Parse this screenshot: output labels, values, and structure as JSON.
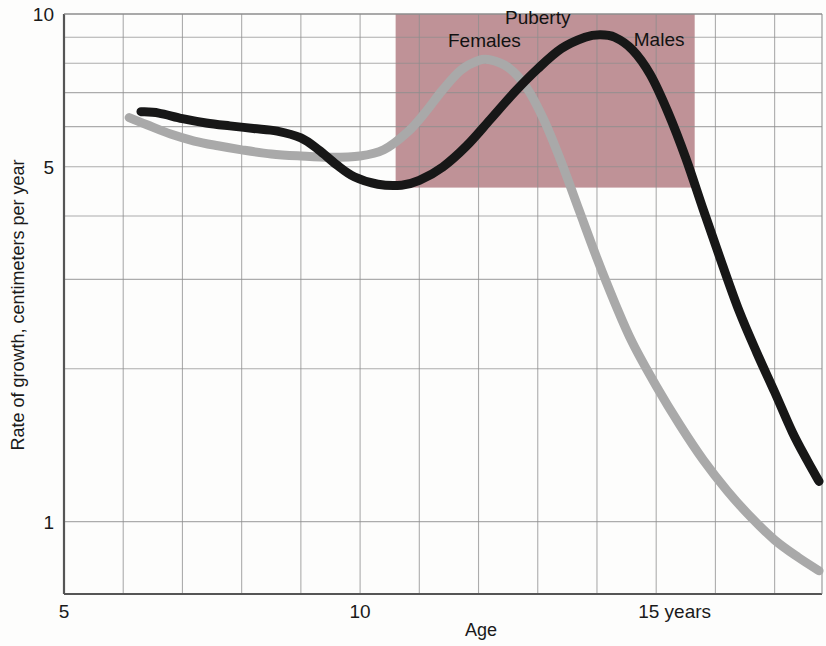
{
  "chart_data": {
    "type": "line",
    "title": "",
    "subtitle": "",
    "xlabel": "Age",
    "ylabel": "Rate of growth, centimeters per year",
    "xlim": [
      5,
      17.8
    ],
    "ylim": [
      0.72,
      10
    ],
    "yscale": "log",
    "grid": true,
    "legend_position": "inline-annotations",
    "x_ticks": [
      {
        "value": 5,
        "label": "5"
      },
      {
        "value": 10,
        "label": "10"
      },
      {
        "value": 15,
        "label": "15 years"
      }
    ],
    "x_gridlines": [
      5,
      6,
      7,
      8,
      9,
      10,
      11,
      12,
      13,
      14,
      15,
      16,
      17
    ],
    "y_ticks": [
      {
        "value": 10,
        "label": "10"
      },
      {
        "value": 5,
        "label": "5"
      },
      {
        "value": 1,
        "label": "1"
      }
    ],
    "y_gridlines": [
      10,
      9,
      8,
      7,
      6,
      5,
      4,
      3,
      2,
      1
    ],
    "shaded_regions": [
      {
        "name": "puberty",
        "label": "Puberty",
        "x_start": 10.6,
        "x_end": 15.65,
        "y_bottom": 4.55,
        "y_top": 10,
        "color": "#bf9297"
      }
    ],
    "annotations": [
      {
        "text": "Puberty",
        "x": 13.0,
        "y": 9.55
      },
      {
        "text": "Females",
        "x": 12.1,
        "y": 8.6
      },
      {
        "text": "Males",
        "x": 15.05,
        "y": 8.65
      }
    ],
    "series": [
      {
        "name": "Females",
        "label": "Females",
        "color": "#a9a9a9",
        "linewidth": 9,
        "points": [
          [
            6.1,
            6.25
          ],
          [
            6.4,
            6.05
          ],
          [
            6.8,
            5.8
          ],
          [
            7.2,
            5.62
          ],
          [
            7.6,
            5.5
          ],
          [
            8.0,
            5.4
          ],
          [
            8.5,
            5.3
          ],
          [
            9.0,
            5.25
          ],
          [
            9.5,
            5.22
          ],
          [
            10.0,
            5.25
          ],
          [
            10.4,
            5.4
          ],
          [
            10.8,
            5.85
          ],
          [
            11.1,
            6.4
          ],
          [
            11.4,
            7.1
          ],
          [
            11.7,
            7.75
          ],
          [
            12.0,
            8.1
          ],
          [
            12.2,
            8.12
          ],
          [
            12.5,
            7.85
          ],
          [
            12.8,
            7.2
          ],
          [
            13.1,
            6.2
          ],
          [
            13.4,
            5.1
          ],
          [
            13.7,
            4.1
          ],
          [
            14.0,
            3.3
          ],
          [
            14.3,
            2.7
          ],
          [
            14.6,
            2.25
          ],
          [
            15.0,
            1.85
          ],
          [
            15.4,
            1.55
          ],
          [
            15.8,
            1.32
          ],
          [
            16.2,
            1.15
          ],
          [
            16.6,
            1.02
          ],
          [
            17.0,
            0.92
          ],
          [
            17.4,
            0.85
          ],
          [
            17.75,
            0.8
          ]
        ]
      },
      {
        "name": "Males",
        "label": "Males",
        "color": "#171717",
        "linewidth": 9,
        "points": [
          [
            6.3,
            6.42
          ],
          [
            6.6,
            6.38
          ],
          [
            7.0,
            6.22
          ],
          [
            7.4,
            6.1
          ],
          [
            7.8,
            6.02
          ],
          [
            8.2,
            5.95
          ],
          [
            8.6,
            5.88
          ],
          [
            9.0,
            5.7
          ],
          [
            9.3,
            5.4
          ],
          [
            9.6,
            5.05
          ],
          [
            9.9,
            4.78
          ],
          [
            10.3,
            4.62
          ],
          [
            10.7,
            4.6
          ],
          [
            11.0,
            4.7
          ],
          [
            11.4,
            5.0
          ],
          [
            11.8,
            5.5
          ],
          [
            12.2,
            6.2
          ],
          [
            12.6,
            7.0
          ],
          [
            13.0,
            7.8
          ],
          [
            13.4,
            8.55
          ],
          [
            13.8,
            9.0
          ],
          [
            14.05,
            9.1
          ],
          [
            14.3,
            9.0
          ],
          [
            14.6,
            8.5
          ],
          [
            14.9,
            7.6
          ],
          [
            15.2,
            6.4
          ],
          [
            15.5,
            5.2
          ],
          [
            15.8,
            4.1
          ],
          [
            16.1,
            3.25
          ],
          [
            16.4,
            2.6
          ],
          [
            16.7,
            2.15
          ],
          [
            17.0,
            1.8
          ],
          [
            17.3,
            1.5
          ],
          [
            17.55,
            1.32
          ],
          [
            17.75,
            1.2
          ]
        ]
      }
    ]
  },
  "colors": {
    "plot_background": "#fdfdfc",
    "grid": "#8e8e8e",
    "axis": "#555555",
    "puberty_shade": "#bf9297",
    "males_line": "#171717",
    "females_line": "#a9a9a9",
    "text": "#121212"
  }
}
